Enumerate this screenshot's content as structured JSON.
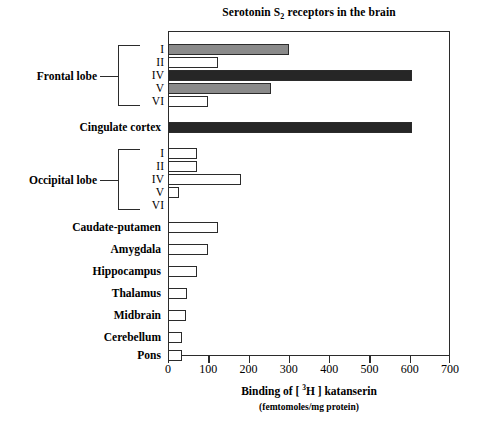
{
  "chart_data": {
    "type": "bar",
    "orientation": "horizontal",
    "title": "Serotonin S2 receptors in the brain",
    "title_main": "Serotonin  S",
    "title_sub": "2",
    "title_tail": "  receptors in the brain",
    "xlabel_line1_pre": "Binding of [ ",
    "xlabel_line1_sup": "3",
    "xlabel_line1_post": "H ] katanserin",
    "xlabel_line2": "(femtomoles/mg protein)",
    "ylabel": "",
    "xlim": [
      0,
      700
    ],
    "xticks": [
      0,
      100,
      200,
      300,
      400,
      500,
      600,
      700
    ],
    "xticklabels": [
      "0",
      "100",
      "200",
      "300",
      "400",
      "500",
      "600",
      "700"
    ],
    "grid": false,
    "legend": false,
    "categories": [
      "Frontal lobe I",
      "Frontal lobe II",
      "Frontal lobe IV",
      "Frontal lobe V",
      "Frontal lobe VI",
      "Cingulate cortex",
      "Occipital lobe I",
      "Occipital lobe II",
      "Occipital lobe IV",
      "Occipital lobe V",
      "Occipital lobe VI",
      "Caudate-putamen",
      "Amygdala",
      "Hippocampus",
      "Thalamus",
      "Midbrain",
      "Cerebellum",
      "Pons"
    ],
    "values": [
      300,
      125,
      605,
      255,
      100,
      605,
      72,
      72,
      180,
      28,
      0,
      125,
      100,
      72,
      48,
      45,
      35,
      35
    ],
    "bar_shades": [
      "gray",
      "white",
      "dark",
      "gray",
      "white",
      "dark",
      "white",
      "white",
      "white",
      "white",
      "white",
      "white",
      "white",
      "white",
      "white",
      "white",
      "white",
      "white"
    ]
  },
  "colors": {
    "gray": "#8a8a8a",
    "dark": "#262626",
    "white": "#ffffff",
    "outline": "#2b2b2b"
  },
  "groups": [
    {
      "label": "Frontal lobe",
      "members": [
        "I",
        "II",
        "IV",
        "V",
        "VI"
      ]
    },
    {
      "label": "Occipital lobe",
      "members": [
        "I",
        "II",
        "IV",
        "V",
        "VI"
      ]
    }
  ],
  "y_items": [
    {
      "kind": "roman",
      "label": "I"
    },
    {
      "kind": "roman",
      "label": "II"
    },
    {
      "kind": "roman",
      "label": "IV"
    },
    {
      "kind": "roman",
      "label": "V"
    },
    {
      "kind": "roman",
      "label": "VI"
    },
    {
      "kind": "name",
      "label": "Cingulate cortex"
    },
    {
      "kind": "roman",
      "label": "I"
    },
    {
      "kind": "roman",
      "label": "II"
    },
    {
      "kind": "roman",
      "label": "IV"
    },
    {
      "kind": "roman",
      "label": "V"
    },
    {
      "kind": "roman",
      "label": "VI"
    },
    {
      "kind": "name",
      "label": "Caudate-putamen"
    },
    {
      "kind": "name",
      "label": "Amygdala"
    },
    {
      "kind": "name",
      "label": "Hippocampus"
    },
    {
      "kind": "name",
      "label": "Thalamus"
    },
    {
      "kind": "name",
      "label": "Midbrain"
    },
    {
      "kind": "name",
      "label": "Cerebellum"
    },
    {
      "kind": "name",
      "label": "Pons"
    }
  ]
}
